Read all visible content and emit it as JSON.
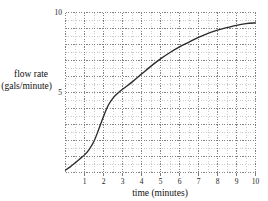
{
  "chart_data": {
    "type": "line",
    "title": "",
    "xlabel": "time (minutes)",
    "ylabel_line1": "flow rate",
    "ylabel_line2": "(gals/minute)",
    "xlim": [
      0,
      10
    ],
    "ylim": [
      0,
      10
    ],
    "grid": "dotted major and minor",
    "grid_major_step": 1,
    "grid_minor_step": 0.5,
    "legend": "none",
    "xticks": [
      1,
      2,
      3,
      4,
      5,
      6,
      7,
      8,
      9,
      10
    ],
    "xtick_labels": [
      "1",
      "2",
      "3",
      "4",
      "5",
      "6",
      "7",
      "8",
      "9",
      "10"
    ],
    "yticks": [
      5,
      10
    ],
    "ytick_labels": [
      "5",
      "10"
    ],
    "series": [
      {
        "name": "flow rate",
        "x": [
          0.0,
          0.25,
          0.5,
          0.75,
          1.0,
          1.25,
          1.5,
          1.75,
          2.0,
          2.25,
          2.5,
          2.75,
          3.0,
          3.5,
          4.0,
          4.5,
          5.0,
          5.5,
          6.0,
          6.5,
          7.0,
          7.5,
          8.0,
          8.5,
          9.0,
          9.5,
          10.0
        ],
        "y": [
          0.15,
          0.35,
          0.6,
          0.85,
          1.1,
          1.45,
          1.95,
          2.7,
          3.5,
          4.2,
          4.65,
          4.95,
          5.2,
          5.65,
          6.15,
          6.65,
          7.1,
          7.5,
          7.85,
          8.15,
          8.45,
          8.7,
          8.9,
          9.05,
          9.2,
          9.3,
          9.35
        ]
      }
    ]
  },
  "colors": {
    "background": "#ffffff",
    "curve": "#2b2b2b",
    "grid_major": "#6d6d6d",
    "grid_minor": "#aaaaaa",
    "text": "#111111"
  }
}
